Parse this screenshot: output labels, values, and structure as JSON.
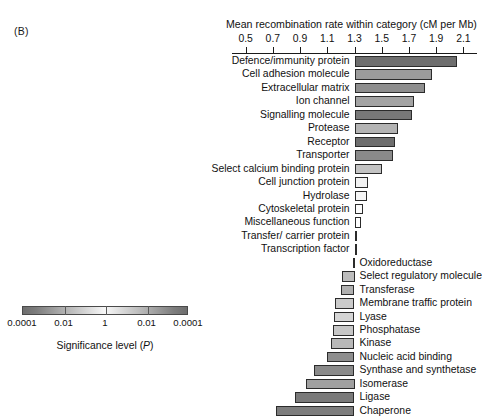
{
  "panel": {
    "label": "(B)"
  },
  "legend": {
    "caption_prefix": "Significance level (",
    "caption_italic": "P",
    "caption_suffix": ")",
    "ticks": [
      "0.0001",
      "0.01",
      "1",
      "0.01",
      "0.0001"
    ],
    "dark_color": "#6e6e6e",
    "light_color": "#f8f8f8"
  },
  "chart_data": {
    "type": "bar",
    "title": "Mean recombination rate within category (cM per Mb)",
    "xlabel": "Mean recombination rate within category (cM per Mb)",
    "ylabel": "",
    "orientation": "horizontal",
    "baseline": 1.3,
    "xlim": [
      0.4,
      2.2
    ],
    "grid": false,
    "legend_position": "bottom-left",
    "tick_values": [
      0.5,
      0.7,
      0.9,
      1.1,
      1.3,
      1.5,
      1.7,
      1.9,
      2.1
    ],
    "tick_labels": [
      "0.5",
      "0.7",
      "0.9",
      "1.1",
      "1.3",
      "1.5",
      "1.7",
      "1.9",
      "2.1"
    ],
    "categories": [
      "Defence/immunity protein",
      "Cell adhesion molecule",
      "Extracellular matrix",
      "Ion channel",
      "Signalling molecule",
      "Protease",
      "Receptor",
      "Transporter",
      "Select calcium binding protein",
      "Cell junction protein",
      "Hydrolase",
      "Cytoskeletal protein",
      "Miscellaneous function",
      "Transfer/ carrier protein",
      "Transcription factor",
      "Oxidoreductase",
      "Select regulatory molecule",
      "Transferase",
      "Membrane traffic protein",
      "Lyase",
      "Phosphatase",
      "Kinase",
      "Nucleic acid binding",
      "Synthase and synthetase",
      "Isomerase",
      "Ligase",
      "Chaperone"
    ],
    "values": [
      2.05,
      1.87,
      1.82,
      1.74,
      1.72,
      1.62,
      1.6,
      1.58,
      1.5,
      1.4,
      1.39,
      1.36,
      1.35,
      1.31,
      1.31,
      1.29,
      1.21,
      1.2,
      1.16,
      1.15,
      1.14,
      1.13,
      1.1,
      1.0,
      0.94,
      0.86,
      0.72
    ],
    "fills": [
      "#6e6e6e",
      "#9b9b9b",
      "#8e8e8e",
      "#a3a3a3",
      "#787878",
      "#b4b4b4",
      "#6e6e6e",
      "#8a8a8a",
      "#c3c3c3",
      "#f2f2f2",
      "#f6f6f6",
      "#fbfbfb",
      "#fdfdfd",
      "#ffffff",
      "#ffffff",
      "#ffffff",
      "#bdbdbd",
      "#b0b0b0",
      "#cacaca",
      "#d5d5d5",
      "#c6c6c6",
      "#b8b8b8",
      "#8e8e8e",
      "#8a8a8a",
      "#a0a0a0",
      "#7a7a7a",
      "#7d7d7d"
    ]
  }
}
